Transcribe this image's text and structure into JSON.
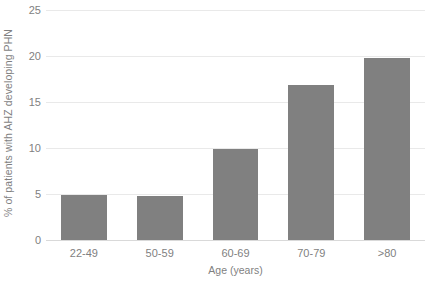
{
  "chart_data": {
    "type": "bar",
    "title": "",
    "subtitle": "",
    "xlabel": "Age (years)",
    "ylabel": "% of patients with AHZ developing PHN",
    "categories": [
      "22-49",
      "50-59",
      "60-69",
      "70-79",
      ">80"
    ],
    "values": [
      4.9,
      4.8,
      9.9,
      16.8,
      19.8
    ],
    "series": [
      {
        "name": "% of patients with AHZ developing PHN",
        "values": [
          4.9,
          4.8,
          9.9,
          16.8,
          19.8
        ]
      }
    ],
    "ylim": [
      0,
      25
    ],
    "xlim": null,
    "yticks": [
      0,
      5,
      10,
      15,
      20,
      25
    ],
    "ytick_labels": [
      "0",
      "5",
      "10",
      "15",
      "20",
      "25"
    ],
    "xtick_labels": [
      "22-49",
      "50-59",
      "60-69",
      "70-79",
      ">80"
    ],
    "grid": "horizontal",
    "legend": "none",
    "bar_color": "#808080",
    "gridline_color": "#e9e9e9",
    "axis_line_color": "#d9d9d9",
    "text_color": "#7f7f7f",
    "background_color": "#ffffff",
    "annotations": []
  }
}
